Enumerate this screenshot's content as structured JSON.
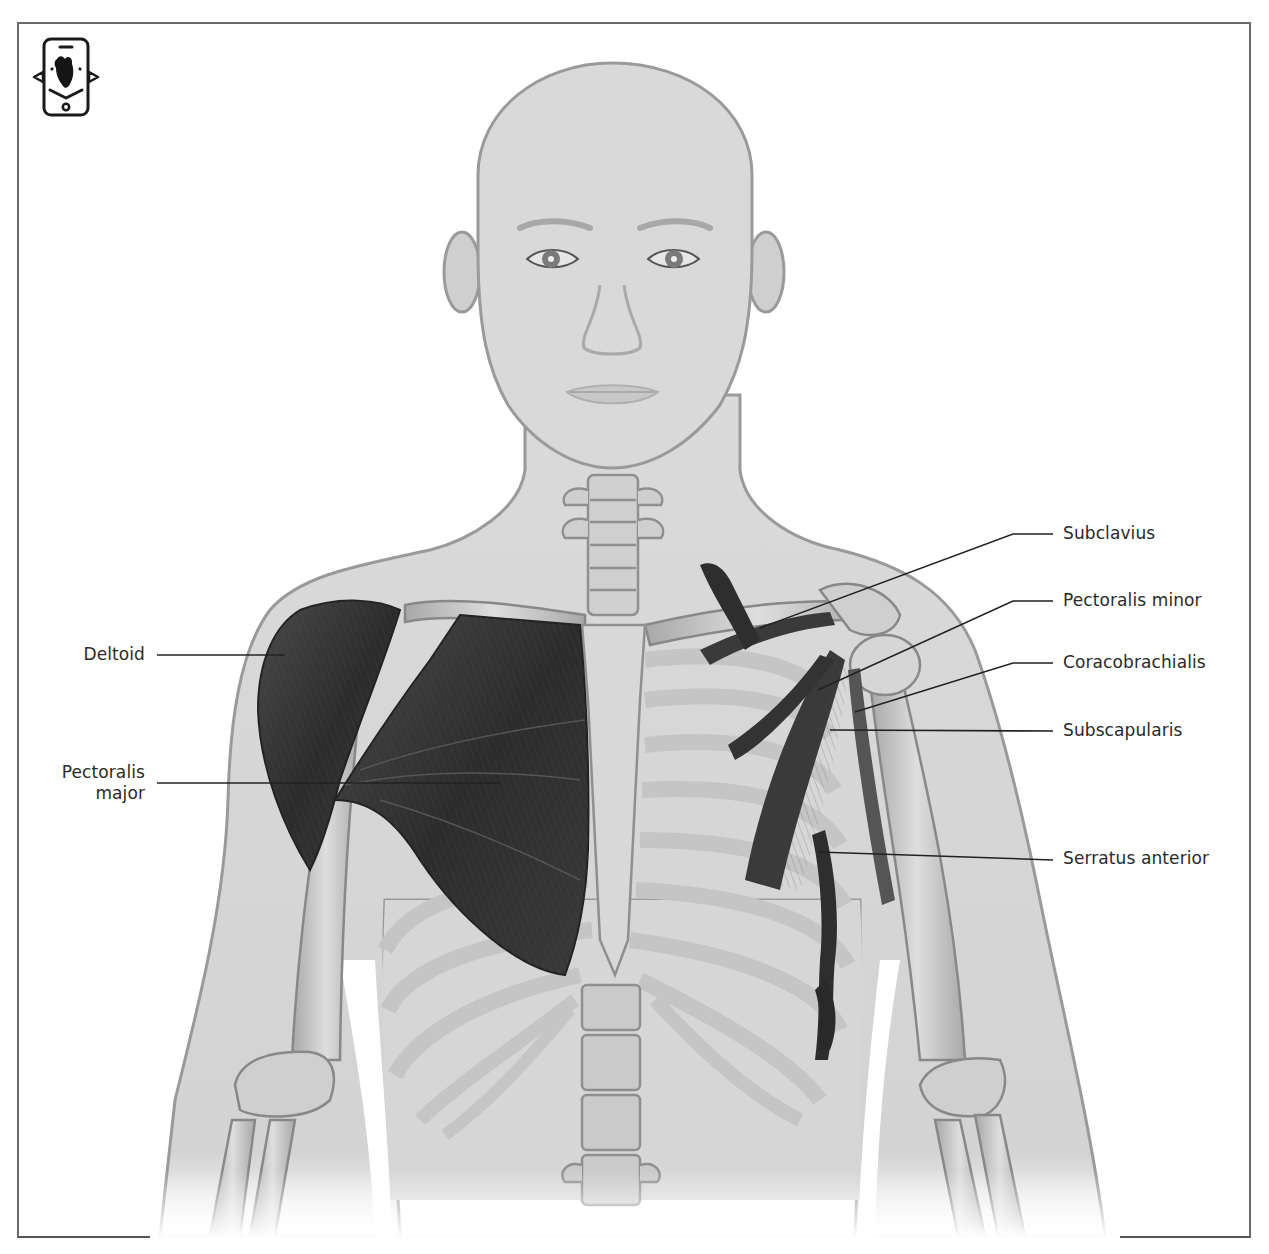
{
  "figure": {
    "type": "anatomical-illustration",
    "icon": {
      "name": "ar-heart-phone-icon"
    },
    "colors": {
      "skin": "#d6d6d6",
      "outline": "#9a9a9a",
      "bone": "#c8c8c8",
      "muscle": "#3a3a3a",
      "label_text": "#2a2a2a",
      "leader_line": "#222222",
      "frame": "#6a6a6a"
    }
  },
  "labels": {
    "left": [
      {
        "id": "deltoid",
        "text": "Deltoid",
        "line_from": [
          157,
          655
        ],
        "line_to": [
          285,
          655
        ]
      },
      {
        "id": "pectoralis-major",
        "line1": "Pectoralis",
        "line2": "major",
        "line_from": [
          157,
          783
        ],
        "line_to": [
          500,
          783
        ]
      }
    ],
    "right": [
      {
        "id": "subclavius",
        "text": "Subclavius",
        "elbow": [
          1013,
          534
        ],
        "line_to": [
          760,
          628
        ]
      },
      {
        "id": "pectoralis-minor",
        "text": "Pectoralis minor",
        "elbow": [
          1013,
          601
        ],
        "line_to": [
          818,
          690
        ]
      },
      {
        "id": "coracobrachialis",
        "text": "Coracobrachialis",
        "elbow": [
          1013,
          663
        ],
        "line_to": [
          855,
          712
        ]
      },
      {
        "id": "subscapularis",
        "text": "Subscapularis",
        "elbow": [
          1053,
          731
        ],
        "line_to": [
          830,
          730
        ]
      },
      {
        "id": "serratus-anterior",
        "text": "Serratus anterior",
        "elbow": [
          1053,
          860
        ],
        "line_to": [
          818,
          852
        ]
      }
    ]
  }
}
